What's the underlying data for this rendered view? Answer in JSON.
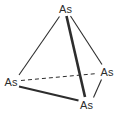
{
  "diagram": {
    "type": "chemical-structure",
    "molecule": "As4 tetrahedron",
    "colors": {
      "background": "#ffffff",
      "line": "#2d2d2d",
      "text": "#2d2d2d"
    },
    "atoms": [
      {
        "element": "As",
        "position": "top",
        "x": 65.5,
        "y": 8.5
      },
      {
        "element": "As",
        "position": "left",
        "x": 11.0,
        "y": 81.5
      },
      {
        "element": "As",
        "position": "right",
        "x": 107.0,
        "y": 71.5
      },
      {
        "element": "As",
        "position": "bottom",
        "x": 86.5,
        "y": 104.5
      }
    ],
    "bonds": [
      {
        "name": "top-left",
        "style": "thin",
        "x1": 59.5,
        "y1": 16.5,
        "x2": 19.0,
        "y2": 75.0
      },
      {
        "name": "top-right",
        "style": "thin",
        "x1": 70.5,
        "y1": 16.0,
        "x2": 102.0,
        "y2": 64.5
      },
      {
        "name": "top-bottom",
        "style": "bold",
        "x1": 66.5,
        "y1": 16.0,
        "x2": 85.0,
        "y2": 97.0
      },
      {
        "name": "left-right",
        "style": "dashed",
        "x1": 21.0,
        "y1": 80.5,
        "x2": 97.5,
        "y2": 73.5
      },
      {
        "name": "left-bottom",
        "style": "medium",
        "x1": 19.0,
        "y1": 86.5,
        "x2": 78.5,
        "y2": 100.5
      },
      {
        "name": "right-bottom",
        "style": "thin",
        "x1": 101.5,
        "y1": 79.5,
        "x2": 93.5,
        "y2": 97.5
      }
    ],
    "bond_styles": {
      "thin": {
        "width": 1.1,
        "dash": null
      },
      "medium": {
        "width": 2.0,
        "dash": null
      },
      "bold": {
        "width": 2.6,
        "dash": null
      },
      "dashed": {
        "width": 1.0,
        "dash": "4 3"
      }
    }
  }
}
